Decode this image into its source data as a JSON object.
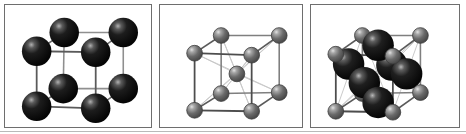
{
  "figure": {
    "panel_count": 3,
    "background_color": "#ffffff",
    "border_color": "#6e6e6e"
  },
  "colors": {
    "large_atom_dark": "#111111",
    "large_atom_highlight": "#9a9a9a",
    "small_atom_gray": "#6b6b6b",
    "small_atom_highlight": "#d8d8d8",
    "bond_front": "#555555",
    "bond_back": "#bfbfbf",
    "panel_border": "#6e6e6e",
    "page_background": "#ffffff"
  },
  "panels": [
    {
      "id": "panel-1",
      "name": "simple-cubic-lattice",
      "label": "",
      "lattice_type": "simple cubic",
      "atom_count": 8,
      "atom_style": "large-dark",
      "atom_radius": 15,
      "corner_atoms": [
        {
          "x": 32,
          "y": 47,
          "role": "front-top-left"
        },
        {
          "x": 92,
          "y": 48,
          "role": "front-top-right"
        },
        {
          "x": 32,
          "y": 103,
          "role": "front-bottom-left"
        },
        {
          "x": 92,
          "y": 105,
          "role": "front-bottom-right"
        },
        {
          "x": 60,
          "y": 28,
          "role": "back-top-left"
        },
        {
          "x": 120,
          "y": 28,
          "role": "back-top-right"
        },
        {
          "x": 59,
          "y": 85,
          "role": "back-bottom-left"
        },
        {
          "x": 120,
          "y": 85,
          "role": "back-bottom-right"
        }
      ],
      "center_atoms": [],
      "face_atoms": [],
      "show_diagonals": false
    },
    {
      "id": "panel-2",
      "name": "body-centered-cubic-lattice",
      "label": "",
      "lattice_type": "body-centered cubic",
      "atom_count": 9,
      "atom_style": "small-gray",
      "atom_radius": 8,
      "corner_atoms": [
        {
          "x": 35,
          "y": 49,
          "role": "front-top-left"
        },
        {
          "x": 93,
          "y": 51,
          "role": "front-top-right"
        },
        {
          "x": 35,
          "y": 107,
          "role": "front-bottom-left"
        },
        {
          "x": 93,
          "y": 108,
          "role": "front-bottom-right"
        },
        {
          "x": 62,
          "y": 31,
          "role": "back-top-left"
        },
        {
          "x": 121,
          "y": 31,
          "role": "back-top-right"
        },
        {
          "x": 62,
          "y": 90,
          "role": "back-bottom-left"
        },
        {
          "x": 121,
          "y": 89,
          "role": "back-bottom-right"
        }
      ],
      "center_atoms": [
        {
          "x": 78,
          "y": 70,
          "role": "body-center"
        }
      ],
      "face_atoms": [],
      "show_diagonals": true
    },
    {
      "id": "panel-3",
      "name": "face-centered-cubic-lattice",
      "label": "",
      "lattice_type": "face-centered cubic",
      "atom_count": 14,
      "atom_style": "mixed",
      "atom_radius": 8,
      "large_atom_radius": 16,
      "corner_atoms": [
        {
          "x": 25,
          "y": 50,
          "role": "front-top-left"
        },
        {
          "x": 83,
          "y": 52,
          "role": "front-top-right"
        },
        {
          "x": 25,
          "y": 108,
          "role": "front-bottom-left"
        },
        {
          "x": 83,
          "y": 109,
          "role": "front-bottom-right"
        },
        {
          "x": 52,
          "y": 31,
          "role": "back-top-left"
        },
        {
          "x": 111,
          "y": 31,
          "role": "back-top-right"
        },
        {
          "x": 52,
          "y": 90,
          "role": "back-bottom-left"
        },
        {
          "x": 111,
          "y": 89,
          "role": "back-bottom-right"
        }
      ],
      "center_atoms": [],
      "face_atoms": [
        {
          "x": 68,
          "y": 41,
          "role": "top-face-center"
        },
        {
          "x": 54,
          "y": 79,
          "role": "front-face-center"
        },
        {
          "x": 97,
          "y": 70,
          "role": "right-face-center"
        },
        {
          "x": 68,
          "y": 99,
          "role": "bottom-face-center"
        },
        {
          "x": 82,
          "y": 61,
          "role": "back-face-center"
        },
        {
          "x": 38,
          "y": 60,
          "role": "left-face-center"
        }
      ],
      "show_diagonals": true
    }
  ]
}
